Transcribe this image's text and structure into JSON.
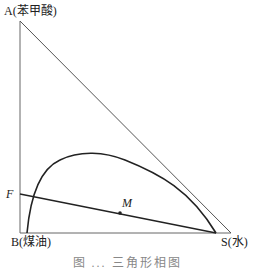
{
  "diagram": {
    "type": "ternary phase diagram (right triangle)",
    "vertices": {
      "A": {
        "label": "A(苯甲酸)",
        "x": 20,
        "y": 21
      },
      "B": {
        "label": "B(煤油)",
        "x": 20,
        "y": 233
      },
      "S": {
        "label": "S(水)",
        "x": 231,
        "y": 233
      }
    },
    "points": {
      "F": {
        "label": "F",
        "x": 20,
        "y": 194
      },
      "M": {
        "label": "M",
        "x": 120,
        "y": 213
      }
    },
    "binodal_curve": {
      "path": "M 27 233 C 30 200, 38 170, 60 160 C 80 150, 105 152, 125 160 C 160 174, 190 190, 216 233"
    },
    "tie_line": {
      "from": "F",
      "to": {
        "x": 216,
        "y": 233
      }
    },
    "caption": "图 ... 三角形相图"
  },
  "colors": {
    "line": "#222222",
    "hypotenuse": "#555555",
    "axis": "#666666"
  }
}
